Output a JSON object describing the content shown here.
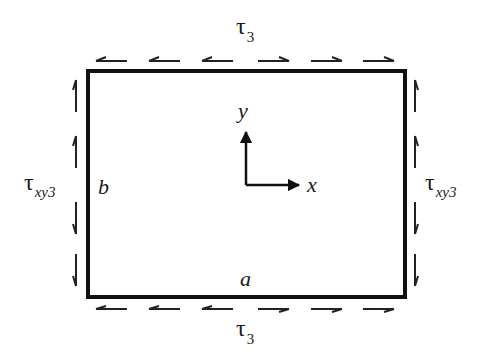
{
  "diagram": {
    "top_label": {
      "symbol": "τ",
      "subscript": "3"
    },
    "bottom_label": {
      "symbol": "τ",
      "subscript": "3"
    },
    "left_label": {
      "symbol": "τ",
      "subscript": "xy3"
    },
    "right_label": {
      "symbol": "τ",
      "subscript": "xy3"
    },
    "side_label_b": "b",
    "side_label_a": "a",
    "axis_x": "x",
    "axis_y": "y",
    "top_arrows": [
      "left",
      "left",
      "left",
      "right",
      "right",
      "right"
    ],
    "bottom_arrows": [
      "left",
      "left",
      "left",
      "right",
      "right",
      "right"
    ],
    "left_arrows": [
      "up",
      "up",
      "down",
      "down"
    ],
    "right_arrows": [
      "up",
      "up",
      "down",
      "down"
    ],
    "colors": {
      "stroke": "#111111",
      "background": "#ffffff"
    }
  }
}
